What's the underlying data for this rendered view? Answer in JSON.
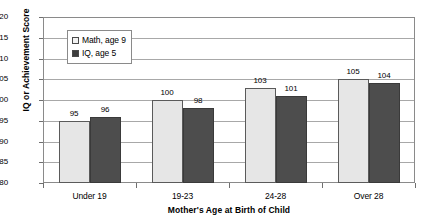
{
  "chart_data": {
    "type": "bar",
    "title": "",
    "xlabel": "Mother's Age at Birth of Child",
    "ylabel": "IQ or Achievement Score",
    "categories": [
      "Under 19",
      "19-23",
      "24-28",
      "Over 28"
    ],
    "series": [
      {
        "name": "Math, age 9",
        "values": [
          95,
          100,
          103,
          105
        ],
        "color": "#e6e6e6"
      },
      {
        "name": "IQ, age 5",
        "values": [
          96,
          98,
          101,
          104
        ],
        "color": "#4d4d4d"
      }
    ],
    "ylim": [
      80,
      120
    ],
    "ytick_step": 5,
    "yticks": [
      120,
      115,
      110,
      105,
      100,
      95,
      90,
      85,
      80
    ],
    "ytick_labels": [
      "120",
      "115",
      "110",
      "105",
      "100",
      "95",
      "90",
      "85",
      "80"
    ],
    "grid": true,
    "legend_position": "upper-left-inside",
    "data_labels": [
      [
        "95",
        "96"
      ],
      [
        "100",
        "98"
      ],
      [
        "103",
        "101"
      ],
      [
        "105",
        "104"
      ]
    ]
  }
}
